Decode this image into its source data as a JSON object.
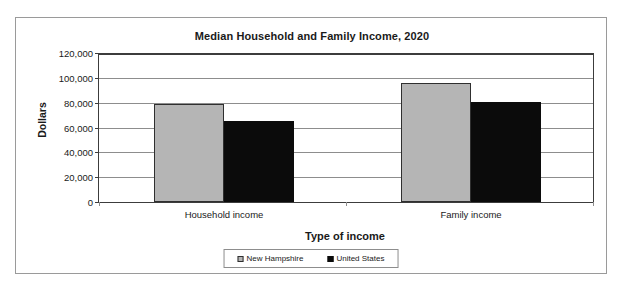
{
  "chart_data": {
    "type": "bar",
    "title": "Median Household and Family Income, 2020",
    "xlabel": "Type of income",
    "ylabel": "Dollars",
    "categories": [
      "Household income",
      "Family income"
    ],
    "series": [
      {
        "name": "New Hampshire",
        "color": "#b5b5b5",
        "values": [
          79000,
          96000
        ]
      },
      {
        "name": "United States",
        "color": "#0b0b0b",
        "values": [
          65000,
          80500
        ]
      }
    ],
    "ylim": [
      0,
      120000
    ],
    "ytick_values": [
      0,
      20000,
      40000,
      60000,
      80000,
      100000,
      120000
    ],
    "ytick_labels": [
      "0",
      "20,000",
      "40,000",
      "60,000",
      "80,000",
      "100,000",
      "120,000"
    ],
    "grid": true,
    "legend_position": "bottom"
  },
  "legend": {
    "entries": [
      {
        "label": "New Hampshire",
        "swatch": "legend-swatch-gray"
      },
      {
        "label": "United States",
        "swatch": "legend-swatch-black"
      }
    ]
  }
}
